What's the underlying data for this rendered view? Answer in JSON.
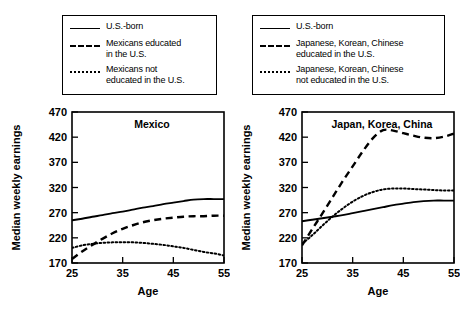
{
  "figure": {
    "panels": [
      {
        "id": "mexico",
        "legend": {
          "entries": [
            {
              "style": "solid",
              "label": "U.S.-born"
            },
            {
              "style": "dashed",
              "label": "Mexicans educated\nin the U.S."
            },
            {
              "style": "dotted",
              "label": "Mexicans not\neducated in the U.S."
            }
          ]
        },
        "chart_data": {
          "type": "line",
          "title": "Mexico",
          "xlabel": "Age",
          "ylabel": "Median weekly earnings",
          "xlim": [
            25,
            55
          ],
          "ylim": [
            170,
            470
          ],
          "xticks": [
            25,
            35,
            45,
            55
          ],
          "yticks": [
            170,
            220,
            270,
            320,
            370,
            420,
            470
          ],
          "grid": false,
          "legend_position": "above-plot",
          "x": [
            25,
            27,
            29,
            31,
            33,
            35,
            37,
            39,
            41,
            43,
            45,
            47,
            49,
            51,
            53,
            55
          ],
          "series": [
            {
              "name": "U.S.-born",
              "style": "solid",
              "values": [
                255,
                258,
                262,
                265,
                269,
                272,
                276,
                280,
                283,
                287,
                290,
                293,
                296,
                297,
                297,
                297
              ]
            },
            {
              "name": "Mexicans educated in the U.S.",
              "style": "dashed",
              "values": [
                178,
                193,
                206,
                218,
                229,
                238,
                245,
                251,
                255,
                258,
                260,
                262,
                263,
                263,
                264,
                264
              ]
            },
            {
              "name": "Mexicans not educated in the U.S.",
              "style": "dotted",
              "values": [
                200,
                205,
                208,
                210,
                211,
                211,
                211,
                210,
                208,
                206,
                203,
                200,
                196,
                192,
                189,
                185
              ]
            }
          ]
        }
      },
      {
        "id": "japan-korea-china",
        "legend": {
          "entries": [
            {
              "style": "solid",
              "label": "U.S.-born"
            },
            {
              "style": "dashed",
              "label": "Japanese, Korean, Chinese\neducated in the U.S."
            },
            {
              "style": "dotted",
              "label": "Japanese, Korean, Chinese\nnot educated in the U.S."
            }
          ]
        },
        "chart_data": {
          "type": "line",
          "title": "Japan, Korea, China",
          "xlabel": "Age",
          "ylabel": "Median weekly earnings",
          "xlim": [
            25,
            55
          ],
          "ylim": [
            170,
            470
          ],
          "xticks": [
            25,
            35,
            45,
            55
          ],
          "yticks": [
            170,
            220,
            270,
            320,
            370,
            420,
            470
          ],
          "grid": false,
          "legend_position": "above-plot",
          "x": [
            25,
            27,
            29,
            31,
            33,
            35,
            37,
            39,
            41,
            43,
            45,
            47,
            49,
            51,
            53,
            55
          ],
          "series": [
            {
              "name": "U.S.-born",
              "style": "solid",
              "values": [
                253,
                256,
                259,
                262,
                265,
                269,
                273,
                277,
                281,
                285,
                288,
                291,
                293,
                294,
                294,
                294
              ]
            },
            {
              "name": "Japanese, Korean, Chinese educated in the U.S.",
              "style": "dashed",
              "values": [
                205,
                237,
                268,
                300,
                332,
                362,
                392,
                418,
                434,
                433,
                428,
                423,
                419,
                418,
                421,
                427
              ]
            },
            {
              "name": "Japanese, Korean, Chinese not educated in the U.S.",
              "style": "dotted",
              "values": [
                208,
                225,
                244,
                262,
                278,
                292,
                303,
                311,
                316,
                318,
                318,
                317,
                316,
                315,
                314,
                314
              ]
            }
          ]
        }
      }
    ]
  }
}
